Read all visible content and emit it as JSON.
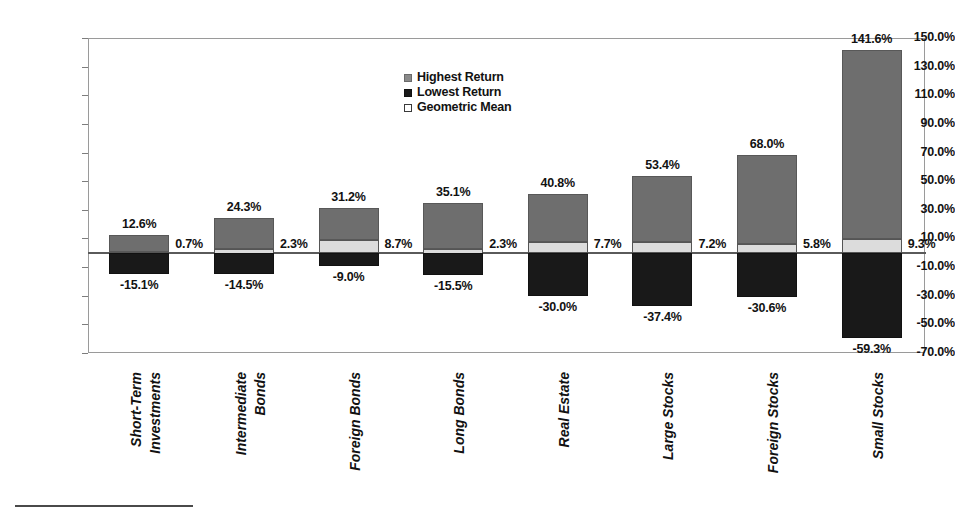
{
  "chart_data": {
    "type": "bar",
    "title": "",
    "subtitle": "",
    "xlabel": "",
    "ylabel": "",
    "ylim": [
      -70,
      150
    ],
    "grid": false,
    "legend_position": "top-center",
    "y_ticks": [
      "150.0%",
      "130.0%",
      "110.0%",
      "90.0%",
      "70.0%",
      "50.0%",
      "30.0%",
      "10.0%",
      "-10.0%",
      "-30.0%",
      "-50.0%",
      "-70.0%"
    ],
    "y_tick_values": [
      150,
      130,
      110,
      90,
      70,
      50,
      30,
      10,
      -10,
      -30,
      -50,
      -70
    ],
    "categories": [
      "Short-Term Investments",
      "Intermediate Bonds",
      "Foreign Bonds",
      "Long Bonds",
      "Real Estate",
      "Large Stocks",
      "Foreign Stocks",
      "Small Stocks"
    ],
    "category_lines": [
      [
        "Short-Term",
        "Investments"
      ],
      [
        "Intermediate",
        "Bonds"
      ],
      [
        "Foreign Bonds"
      ],
      [
        "Long Bonds"
      ],
      [
        "Real Estate"
      ],
      [
        "Large Stocks"
      ],
      [
        "Foreign Stocks"
      ],
      [
        "Small Stocks"
      ]
    ],
    "series": [
      {
        "name": "Highest Return",
        "color": "#6e6e6e",
        "values": [
          12.6,
          24.3,
          31.2,
          35.1,
          40.8,
          53.4,
          68.0,
          141.6
        ],
        "labels": [
          "12.6%",
          "24.3%",
          "31.2%",
          "35.1%",
          "40.8%",
          "53.4%",
          "68.0%",
          "141.6%"
        ]
      },
      {
        "name": "Lowest Return",
        "color": "#191919",
        "values": [
          -15.1,
          -14.5,
          -9.0,
          -15.5,
          -30.0,
          -37.4,
          -30.6,
          -59.3
        ],
        "labels": [
          "-15.1%",
          "-14.5%",
          "-9.0%",
          "-15.5%",
          "-30.0%",
          "-37.4%",
          "-30.6%",
          "-59.3%"
        ]
      },
      {
        "name": "Geometric Mean",
        "color": "#dcdcdc",
        "values": [
          0.7,
          2.3,
          8.7,
          2.3,
          7.7,
          7.2,
          5.8,
          9.3
        ],
        "labels": [
          "0.7%",
          "2.3%",
          "8.7%",
          "2.3%",
          "7.7%",
          "7.2%",
          "5.8%",
          "9.3%"
        ]
      }
    ]
  },
  "legend": {
    "items": [
      {
        "label": "Highest Return",
        "swatch": "gray-swatch"
      },
      {
        "label": "Lowest Return",
        "swatch": "black-swatch"
      },
      {
        "label": "Geometric Mean",
        "swatch": "white-swatch"
      }
    ]
  }
}
